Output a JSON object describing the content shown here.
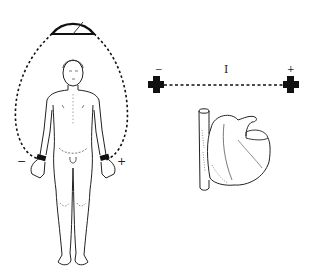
{
  "diagram": {
    "galvanometer": {
      "label": ""
    },
    "body_electrodes": {
      "left_sign": "−",
      "right_sign": "+"
    },
    "lead_schematic": {
      "lead_label": "I",
      "negative_sign": "−",
      "positive_sign": "+"
    },
    "colors": {
      "line": "#111111",
      "background": "#ffffff"
    }
  }
}
